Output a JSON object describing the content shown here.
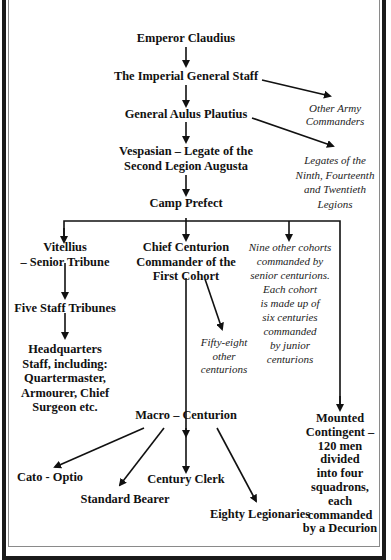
{
  "diagram": {
    "title_fragment": "",
    "nodes": {
      "emperor": "Emperor Claudius",
      "staff": "The Imperial General Staff",
      "general": "General Aulus Plautius",
      "legate_line1": "Vespasian – Legate of the",
      "legate_line2": "Second Legion Augusta",
      "prefect": "Camp Prefect",
      "tribune_line1": "Vitellius",
      "tribune_line2": "– Senior Tribune",
      "chief_line1": "Chief Centurion",
      "chief_line2": "Commander of the",
      "chief_line3": "First Cohort",
      "staff_tribunes": "Five Staff Tribunes",
      "hq_line1": "Headquarters",
      "hq_line2": "Staff, including:",
      "hq_line3": "Quartermaster,",
      "hq_line4": "Armourer, Chief",
      "hq_line5": "Surgeon etc.",
      "macro": "Macro – Centurion",
      "cato": "Cato - Optio",
      "standard": "Standard Bearer",
      "clerk": "Century Clerk",
      "legionaries": "Eighty Legionaries",
      "mounted_line1": "Mounted",
      "mounted_line2": "Contingent –",
      "mounted_line3": "120 men",
      "mounted_line4": "divided",
      "mounted_line5": "into four",
      "mounted_line6": "squadrons,",
      "mounted_line7": "each",
      "mounted_line8": "commanded",
      "mounted_line9": "by a Decurion"
    },
    "notes": {
      "other_army_line1": "Other Army",
      "other_army_line2": "Commanders",
      "legates_line1": "Legates of the",
      "legates_line2": "Ninth, Fourteenth",
      "legates_line3": "and Twentieth",
      "legates_line4": "Legions",
      "cohorts_line1": "Nine other cohorts",
      "cohorts_line2": "commanded by",
      "cohorts_line3": "senior centurions.",
      "cohorts_line4": "Each  cohort",
      "cohorts_line5": "is made up of",
      "cohorts_line6": "six centuries",
      "cohorts_line7": "commanded",
      "cohorts_line8": "by junior",
      "cohorts_line9": "centurions",
      "fiftyeight_line1": "Fifty-eight",
      "fiftyeight_line2": "other",
      "fiftyeight_line3": "centurions"
    }
  }
}
